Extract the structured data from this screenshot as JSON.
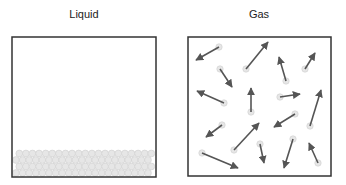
{
  "panels": [
    {
      "title": "Liquid",
      "box": {
        "x": 12,
        "y": 37,
        "w": 144,
        "h": 140
      }
    },
    {
      "title": "Gas",
      "box": {
        "x": 188,
        "y": 37,
        "w": 143,
        "h": 139
      }
    }
  ],
  "colors": {
    "border": "#333333",
    "arrow": "#555555",
    "particle": "#e6e6e6",
    "particle_stroke": "#cfcfcf"
  },
  "gas_arrows": [
    {
      "from": [
        219,
        47
      ],
      "to": [
        196,
        60
      ]
    },
    {
      "from": [
        246,
        69
      ],
      "to": [
        268,
        42
      ]
    },
    {
      "from": [
        220,
        69
      ],
      "to": [
        232,
        87
      ]
    },
    {
      "from": [
        286,
        81
      ],
      "to": [
        279,
        57
      ]
    },
    {
      "from": [
        305,
        69
      ],
      "to": [
        315,
        53
      ]
    },
    {
      "from": [
        224,
        103
      ],
      "to": [
        197,
        91
      ]
    },
    {
      "from": [
        251,
        112
      ],
      "to": [
        251,
        88
      ]
    },
    {
      "from": [
        280,
        97
      ],
      "to": [
        300,
        94
      ]
    },
    {
      "from": [
        295,
        114
      ],
      "to": [
        274,
        127
      ]
    },
    {
      "from": [
        310,
        126
      ],
      "to": [
        321,
        90
      ]
    },
    {
      "from": [
        222,
        125
      ],
      "to": [
        206,
        137
      ]
    },
    {
      "from": [
        234,
        150
      ],
      "to": [
        259,
        123
      ]
    },
    {
      "from": [
        202,
        153
      ],
      "to": [
        238,
        168
      ]
    },
    {
      "from": [
        260,
        144
      ],
      "to": [
        264,
        163
      ]
    },
    {
      "from": [
        293,
        139
      ],
      "to": [
        284,
        168
      ]
    },
    {
      "from": [
        318,
        163
      ],
      "to": [
        309,
        143
      ]
    }
  ]
}
